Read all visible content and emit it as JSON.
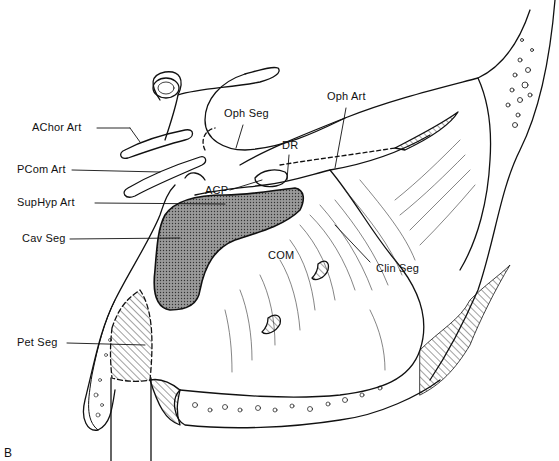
{
  "figure": {
    "panel_letter": "B",
    "colors": {
      "ink": "#111111",
      "paper": "#ffffff",
      "stipple": "#7a7a7a"
    }
  },
  "labels": [
    {
      "id": "achor-art",
      "text": "AChor Art",
      "x": 32,
      "y": 128
    },
    {
      "id": "pcom-art",
      "text": "PCom Art",
      "x": 17,
      "y": 166
    },
    {
      "id": "suphyp-art",
      "text": "SupHyp Art",
      "x": 17,
      "y": 198
    },
    {
      "id": "cav-seg",
      "text": "Cav Seg",
      "x": 22,
      "y": 233
    },
    {
      "id": "oph-seg",
      "text": "Oph Seg",
      "x": 224,
      "y": 112
    },
    {
      "id": "oph-art",
      "text": "Oph Art",
      "x": 327,
      "y": 95
    },
    {
      "id": "dr",
      "text": "DR",
      "x": 282,
      "y": 143
    },
    {
      "id": "acp",
      "text": "ACP",
      "x": 205,
      "y": 188
    },
    {
      "id": "com",
      "text": "COM",
      "x": 268,
      "y": 252
    },
    {
      "id": "clin-seg",
      "text": "Clin Seg",
      "x": 376,
      "y": 264
    },
    {
      "id": "pet-seg",
      "text": "Pet Seg",
      "x": 17,
      "y": 337
    }
  ]
}
